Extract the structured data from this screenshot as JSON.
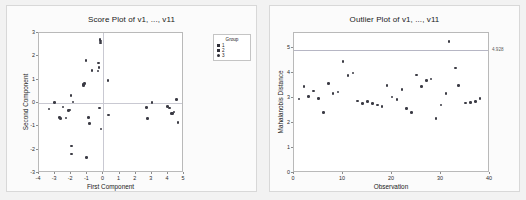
{
  "chart_data": [
    {
      "type": "scatter",
      "id": "score-plot",
      "title": "Score Plot of v1, ..., v11",
      "xlabel": "First Component",
      "ylabel": "Second Component",
      "xlim": [
        -4,
        5
      ],
      "ylim": [
        -3,
        3
      ],
      "xticks": [
        "-4",
        "-3",
        "-2",
        "-1",
        "0",
        "1",
        "2",
        "3",
        "4",
        "5"
      ],
      "xtick_values": [
        -4,
        -3,
        -2,
        -1,
        0,
        1,
        2,
        3,
        4,
        5
      ],
      "yticks": [
        "-3",
        "-2",
        "-1",
        "0",
        "1",
        "2",
        "3"
      ],
      "ytick_values": [
        -3,
        -2,
        -1,
        0,
        1,
        2,
        3
      ],
      "grid": false,
      "reference_lines": {
        "x": 0,
        "y": 0
      },
      "legend": {
        "position": "top-right-outside",
        "title": "Group",
        "entries": [
          {
            "label": "1",
            "symbol": "square"
          },
          {
            "label": "2",
            "symbol": "square"
          },
          {
            "label": "3",
            "symbol": "circle"
          }
        ]
      },
      "points": [
        {
          "x": -3.38,
          "y": -0.25
        },
        {
          "x": -3.02,
          "y": 0.02
        },
        {
          "x": -2.72,
          "y": -0.62
        },
        {
          "x": -2.65,
          "y": -0.66
        },
        {
          "x": -2.52,
          "y": -0.18
        },
        {
          "x": -2.32,
          "y": -0.64
        },
        {
          "x": -2.18,
          "y": -0.32
        },
        {
          "x": -2.12,
          "y": -0.3
        },
        {
          "x": -2.02,
          "y": 0.32
        },
        {
          "x": -2.0,
          "y": -1.84
        },
        {
          "x": -1.98,
          "y": -2.18
        },
        {
          "x": -1.88,
          "y": 0.05
        },
        {
          "x": -1.28,
          "y": 0.8
        },
        {
          "x": -1.22,
          "y": 0.76
        },
        {
          "x": -1.18,
          "y": 0.84
        },
        {
          "x": -1.08,
          "y": 1.82
        },
        {
          "x": -1.04,
          "y": -2.34
        },
        {
          "x": -0.92,
          "y": -0.62
        },
        {
          "x": -0.88,
          "y": -0.88
        },
        {
          "x": -0.7,
          "y": 1.4
        },
        {
          "x": -0.34,
          "y": 1.38
        },
        {
          "x": -0.3,
          "y": 1.72
        },
        {
          "x": -0.28,
          "y": 1.52
        },
        {
          "x": -0.26,
          "y": -0.22
        },
        {
          "x": -0.22,
          "y": 2.72
        },
        {
          "x": -0.2,
          "y": 2.66
        },
        {
          "x": -0.18,
          "y": 2.58
        },
        {
          "x": -0.14,
          "y": -1.12
        },
        {
          "x": 0.28,
          "y": 0.96
        },
        {
          "x": 0.32,
          "y": -0.52
        },
        {
          "x": 2.68,
          "y": -0.2
        },
        {
          "x": 2.72,
          "y": -0.66
        },
        {
          "x": 3.02,
          "y": 0.02
        },
        {
          "x": 3.96,
          "y": -0.14
        },
        {
          "x": 4.1,
          "y": -0.22
        },
        {
          "x": 4.22,
          "y": -0.44
        },
        {
          "x": 4.3,
          "y": -0.46
        },
        {
          "x": 4.38,
          "y": -0.38
        },
        {
          "x": 4.52,
          "y": 0.14
        },
        {
          "x": 4.62,
          "y": -0.84
        }
      ]
    },
    {
      "type": "scatter",
      "id": "outlier-plot",
      "title": "Outlier Plot of v1, ..., v11",
      "xlabel": "Observation",
      "ylabel": "Mahalanobis Distance",
      "xlim": [
        0,
        40
      ],
      "ylim": [
        0,
        5.6
      ],
      "xticks": [
        "0",
        "10",
        "20",
        "30",
        "40"
      ],
      "xtick_values": [
        0,
        10,
        20,
        30,
        40
      ],
      "yticks": [
        "0",
        "1",
        "2",
        "3",
        "4",
        "5"
      ],
      "ytick_values": [
        0,
        1,
        2,
        3,
        4,
        5
      ],
      "grid": false,
      "reference_line": {
        "y": 4.928,
        "label": "4.928"
      },
      "points": [
        {
          "x": 1,
          "y": 2.96
        },
        {
          "x": 2,
          "y": 3.46
        },
        {
          "x": 3,
          "y": 3.06
        },
        {
          "x": 4,
          "y": 3.28
        },
        {
          "x": 5,
          "y": 2.98
        },
        {
          "x": 6,
          "y": 2.42
        },
        {
          "x": 7,
          "y": 3.58
        },
        {
          "x": 8,
          "y": 3.18
        },
        {
          "x": 9,
          "y": 3.24
        },
        {
          "x": 10,
          "y": 4.46
        },
        {
          "x": 11,
          "y": 3.9
        },
        {
          "x": 12,
          "y": 4.0
        },
        {
          "x": 13,
          "y": 2.88
        },
        {
          "x": 14,
          "y": 2.78
        },
        {
          "x": 15,
          "y": 2.86
        },
        {
          "x": 16,
          "y": 2.78
        },
        {
          "x": 17,
          "y": 2.72
        },
        {
          "x": 18,
          "y": 2.66
        },
        {
          "x": 19,
          "y": 3.5
        },
        {
          "x": 20,
          "y": 3.04
        },
        {
          "x": 21,
          "y": 2.94
        },
        {
          "x": 22,
          "y": 3.34
        },
        {
          "x": 23,
          "y": 2.58
        },
        {
          "x": 24,
          "y": 2.42
        },
        {
          "x": 25,
          "y": 3.92
        },
        {
          "x": 26,
          "y": 3.46
        },
        {
          "x": 27,
          "y": 3.7
        },
        {
          "x": 28,
          "y": 3.76
        },
        {
          "x": 29,
          "y": 2.18
        },
        {
          "x": 30,
          "y": 2.72
        },
        {
          "x": 31,
          "y": 3.18
        },
        {
          "x": 31.6,
          "y": 5.26
        },
        {
          "x": 33,
          "y": 4.2
        },
        {
          "x": 33.6,
          "y": 3.5
        },
        {
          "x": 35,
          "y": 2.8
        },
        {
          "x": 36,
          "y": 2.82
        },
        {
          "x": 37,
          "y": 2.86
        },
        {
          "x": 38,
          "y": 2.98
        }
      ]
    }
  ]
}
